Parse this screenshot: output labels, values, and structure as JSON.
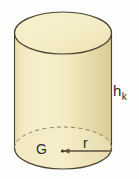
{
  "figure": {
    "kind": "cylinder-diagram",
    "background_color": "#fdfdfb",
    "body_fill": "#f0e6b8",
    "top_fill": "#f5edc4",
    "bottom_fill": "#f3e9bd",
    "shade_fill": "#ddd09a",
    "outline_color": "#4a4434",
    "label_color": "#2b2b2b",
    "dash_color": "#7a7056"
  },
  "labels": {
    "height": "h",
    "height_subscript": "k",
    "base_point": "G",
    "radius": "r"
  },
  "geometry": {
    "left_x": 15,
    "right_x": 112,
    "top_ellipse_center_y": 33,
    "bottom_ellipse_center_y": 148,
    "ellipse_rx": 48.5,
    "ellipse_ry": 21,
    "center_point_x": 63,
    "center_point_y": 151,
    "radius_line_end_x": 112
  },
  "annotations": {
    "radius_arrow": "arrow-left-at-center",
    "hidden_edge": "dashed-upper-arc-of-bottom-ellipse"
  }
}
